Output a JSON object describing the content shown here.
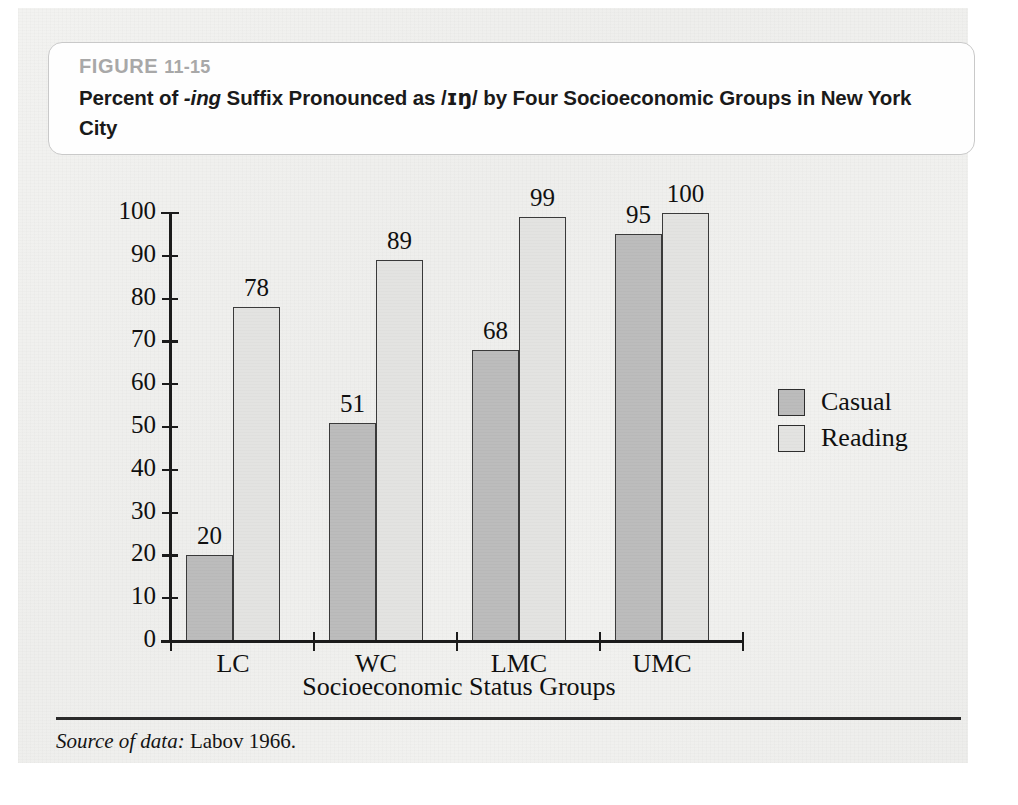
{
  "figure": {
    "number_prefix": "FIGURE",
    "number": "11-15",
    "title_part1": "Percent of ",
    "title_italic": "-ing",
    "title_part2": " Suffix Pronounced as /",
    "title_ipa": "ɪŋ",
    "title_part3": "/ by Four Socioeconomic Groups in New York City"
  },
  "source": {
    "label": "Source of data:",
    "citation": " Labov 1966."
  },
  "chart_data": {
    "type": "bar",
    "title": "Percent of -ing Suffix Pronounced as /ɪŋ/ by Four Socioeconomic Groups in New York City",
    "xlabel": "Socioeconomic Status Groups",
    "ylabel": "",
    "ylim": [
      0,
      100
    ],
    "ytick_step": 10,
    "grid": false,
    "legend_position": "right",
    "categories": [
      "LC",
      "WC",
      "LMC",
      "UMC"
    ],
    "yticks": [
      "0",
      "10",
      "20",
      "30",
      "40",
      "50",
      "60",
      "70",
      "80",
      "90",
      "100"
    ],
    "series": [
      {
        "name": "Casual",
        "color": "#bcbcbc",
        "values": [
          20,
          51,
          68,
          95
        ]
      },
      {
        "name": "Reading",
        "color": "#e3e3e1",
        "values": [
          78,
          89,
          99,
          100
        ]
      }
    ]
  }
}
